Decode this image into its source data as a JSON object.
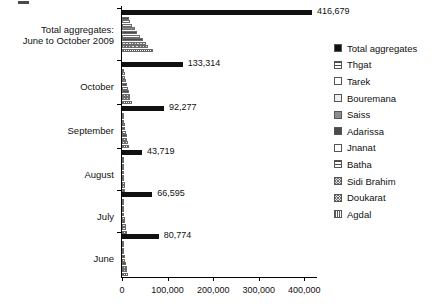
{
  "chart_data": {
    "type": "bar",
    "orientation": "horizontal",
    "title": "",
    "xlabel": "",
    "ylabel": "",
    "xlim": [
      0,
      430000
    ],
    "grid": false,
    "legend_position": "right",
    "x_ticks": [
      {
        "value": 0,
        "label": "0"
      },
      {
        "value": 100000,
        "label": "100,000"
      },
      {
        "value": 200000,
        "label": "200,000"
      },
      {
        "value": 300000,
        "label": "300,000"
      },
      {
        "value": 400000,
        "label": "400,000"
      }
    ],
    "categories": [
      "Total aggregates: June to October 2009",
      "October",
      "September",
      "August",
      "July",
      "June"
    ],
    "category_labels": [
      [
        "Total aggregates:",
        "June to October 2009"
      ],
      [
        "October"
      ],
      [
        "September"
      ],
      [
        "August"
      ],
      [
        "July"
      ],
      [
        "June"
      ]
    ],
    "total_labels": [
      "416,679",
      "133,314",
      "92,277",
      "43,719",
      "66,595",
      "80,774"
    ],
    "series": [
      {
        "name": "Total aggregates",
        "pattern": "solid-black",
        "values": [
          416679,
          133314,
          92277,
          43719,
          66595,
          80774
        ]
      },
      {
        "name": "Thgat",
        "pattern": "horizontal-lines",
        "values": [
          14500,
          4600,
          3200,
          1500,
          2300,
          2800
        ]
      },
      {
        "name": "Tarek",
        "pattern": "white",
        "values": [
          17500,
          5600,
          3900,
          1800,
          2800,
          3400
        ]
      },
      {
        "name": "Bouremana",
        "pattern": "light-dots",
        "values": [
          22000,
          7000,
          4900,
          2300,
          3500,
          4300
        ]
      },
      {
        "name": "Saiss",
        "pattern": "gray",
        "values": [
          27500,
          8800,
          6100,
          2900,
          4400,
          5300
        ]
      },
      {
        "name": "Adarissa",
        "pattern": "dark-gray",
        "values": [
          33000,
          10500,
          7300,
          3500,
          5300,
          6400
        ]
      },
      {
        "name": "Jnanat",
        "pattern": "white-outline",
        "values": [
          38500,
          12300,
          8500,
          4000,
          6100,
          7500
        ]
      },
      {
        "name": "Batha",
        "pattern": "horizontal-lines",
        "values": [
          46000,
          14700,
          10200,
          4800,
          7300,
          8900
        ]
      },
      {
        "name": "Sidi Brahim",
        "pattern": "crosshatch",
        "values": [
          52000,
          16600,
          11500,
          5500,
          8300,
          10100
        ]
      },
      {
        "name": "Doukarat",
        "pattern": "crosshatch",
        "values": [
          57500,
          18400,
          12700,
          6000,
          9200,
          11100
        ]
      },
      {
        "name": "Agdal",
        "pattern": "vertical-lines",
        "values": [
          68000,
          21800,
          15100,
          7200,
          10900,
          13200
        ]
      }
    ]
  },
  "legend": {
    "items": [
      {
        "label": "Total aggregates",
        "pattern": "solid-black"
      },
      {
        "label": "Thgat",
        "pattern": "horizontal-lines"
      },
      {
        "label": "Tarek",
        "pattern": "white"
      },
      {
        "label": "Bouremana",
        "pattern": "light-dots"
      },
      {
        "label": "Saiss",
        "pattern": "gray"
      },
      {
        "label": "Adarissa",
        "pattern": "dark-gray"
      },
      {
        "label": "Jnanat",
        "pattern": "white-outline"
      },
      {
        "label": "Batha",
        "pattern": "horizontal-lines"
      },
      {
        "label": "Sidi Brahim",
        "pattern": "crosshatch"
      },
      {
        "label": "Doukarat",
        "pattern": "crosshatch"
      },
      {
        "label": "Agdal",
        "pattern": "vertical-lines"
      }
    ]
  }
}
